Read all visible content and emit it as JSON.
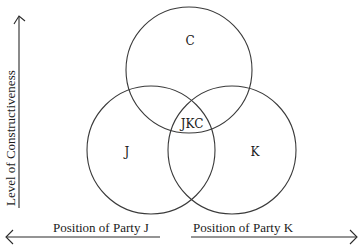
{
  "diagram": {
    "type": "venn",
    "y_axis": {
      "label": "Level of Constructiveness",
      "direction": "up"
    },
    "x_axis_left": {
      "label": "Position of Party J",
      "direction": "left"
    },
    "x_axis_right": {
      "label": "Position of Party K",
      "direction": "right"
    },
    "sets": [
      {
        "id": "C",
        "label": "C"
      },
      {
        "id": "J",
        "label": "J"
      },
      {
        "id": "K",
        "label": "K"
      }
    ],
    "intersection": {
      "sets": [
        "J",
        "K",
        "C"
      ],
      "label": "JKC"
    },
    "colors": {
      "stroke": "#3a3a3a",
      "text": "#1a1a1a",
      "background": "#ffffff"
    }
  }
}
